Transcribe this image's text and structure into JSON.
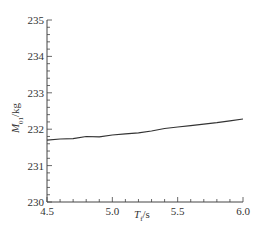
{
  "chart_data": {
    "type": "line",
    "title": "",
    "xlabel": "T_f/s",
    "ylabel": "M_01/kg",
    "xlim": [
      4.5,
      6.0
    ],
    "ylim": [
      230,
      235
    ],
    "x_ticks": [
      "4.5",
      "5.0",
      "5.5",
      "6.0"
    ],
    "y_ticks": [
      "230",
      "231",
      "232",
      "233",
      "234",
      "235"
    ],
    "x_minor_step": 0.1,
    "y_minor_step": 0.2,
    "grid": false,
    "legend": null,
    "series": [
      {
        "name": "M_01",
        "color": "#333333",
        "x": [
          4.5,
          4.6,
          4.7,
          4.8,
          4.9,
          5.0,
          5.1,
          5.2,
          5.3,
          5.4,
          5.5,
          5.6,
          5.7,
          5.8,
          5.9,
          6.0
        ],
        "values": [
          231.7,
          231.73,
          231.74,
          231.8,
          231.79,
          231.84,
          231.87,
          231.9,
          231.95,
          232.02,
          232.06,
          232.1,
          232.14,
          232.18,
          232.23,
          232.28
        ]
      }
    ]
  },
  "labels": {
    "x_main": "T",
    "x_sub": "f",
    "x_unit": "/s",
    "y_main": "M",
    "y_sub": "01",
    "y_unit": "/kg"
  }
}
